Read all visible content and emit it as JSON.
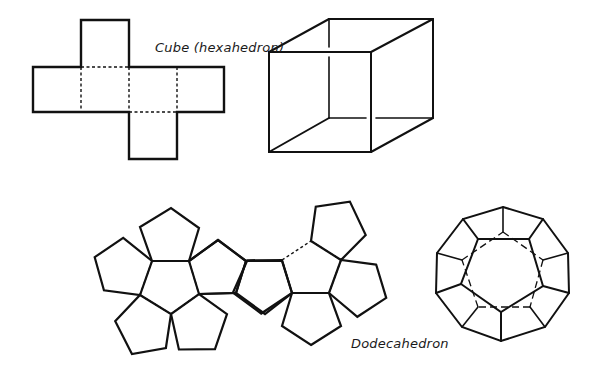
{
  "colors": {
    "stroke": "#111111",
    "background": "#ffffff"
  },
  "labels": {
    "cube": "Cube (hexahedron)",
    "dodecahedron": "Dodecahedron"
  },
  "cube_net": {
    "outline": [
      [
        81,
        20
      ],
      [
        129,
        20
      ],
      [
        129,
        67
      ],
      [
        224,
        67
      ],
      [
        224,
        112
      ],
      [
        177,
        112
      ],
      [
        177,
        159
      ],
      [
        129,
        159
      ],
      [
        129,
        112
      ],
      [
        33,
        112
      ],
      [
        33,
        67
      ],
      [
        81,
        67
      ]
    ],
    "folds": [
      [
        [
          81,
          67
        ],
        [
          129,
          67
        ]
      ],
      [
        [
          81,
          67
        ],
        [
          81,
          112
        ]
      ],
      [
        [
          129,
          67
        ],
        [
          129,
          112
        ]
      ],
      [
        [
          177,
          67
        ],
        [
          177,
          112
        ]
      ],
      [
        [
          129,
          112
        ],
        [
          177,
          112
        ]
      ]
    ]
  },
  "cube_3d": {
    "visible": [
      [
        [
          269,
          52
        ],
        [
          371,
          52
        ]
      ],
      [
        [
          371,
          52
        ],
        [
          371,
          152
        ]
      ],
      [
        [
          371,
          152
        ],
        [
          269,
          152
        ]
      ],
      [
        [
          269,
          152
        ],
        [
          269,
          52
        ]
      ],
      [
        [
          269,
          52
        ],
        [
          329,
          19
        ]
      ],
      [
        [
          329,
          19
        ],
        [
          433,
          19
        ]
      ],
      [
        [
          433,
          19
        ],
        [
          433,
          118
        ]
      ],
      [
        [
          371,
          52
        ],
        [
          433,
          19
        ]
      ],
      [
        [
          371,
          152
        ],
        [
          433,
          118
        ]
      ],
      [
        [
          269,
          152
        ],
        [
          329,
          118
        ]
      ]
    ],
    "hidden_broken": [
      [
        [
          329,
          19
        ],
        [
          329,
          47
        ]
      ],
      [
        [
          329,
          57
        ],
        [
          329,
          118
        ]
      ],
      [
        [
          329,
          118
        ],
        [
          366,
          118
        ]
      ],
      [
        [
          376,
          118
        ],
        [
          433,
          118
        ]
      ]
    ]
  },
  "dodeca_net_left": {
    "center": [
      [
        152,
        261
      ],
      [
        189,
        261
      ],
      [
        199,
        294
      ],
      [
        171,
        314
      ],
      [
        140,
        295
      ]
    ]
  },
  "dodeca_net_middle": {
    "pentagons": [
      [
        [
          189,
          261
        ],
        [
          218,
          240
        ],
        [
          246,
          261
        ],
        [
          236,
          293
        ],
        [
          199,
          294
        ]
      ],
      [
        [
          246,
          261
        ],
        [
          282,
          261
        ],
        [
          292,
          293
        ],
        [
          265,
          314
        ],
        [
          236,
          293
        ]
      ]
    ]
  },
  "dodeca_net_right": {
    "center": [
      [
        311,
        241
      ],
      [
        341,
        260
      ],
      [
        329,
        293
      ],
      [
        292,
        293
      ],
      [
        282,
        260
      ]
    ]
  },
  "dodeca_3d": {
    "outer": [
      [
        503,
        207
      ],
      [
        543,
        219
      ],
      [
        568,
        253
      ],
      [
        569,
        293
      ],
      [
        545,
        327
      ],
      [
        501,
        341
      ],
      [
        462,
        327
      ],
      [
        436,
        293
      ],
      [
        437,
        253
      ],
      [
        463,
        219
      ]
    ],
    "inner": [
      [
        478,
        239
      ],
      [
        529,
        239
      ],
      [
        543,
        286
      ],
      [
        501,
        312
      ],
      [
        461,
        284
      ]
    ],
    "back": [
      [
        503,
        232
      ],
      [
        543,
        260
      ],
      [
        530,
        307
      ],
      [
        478,
        307
      ],
      [
        462,
        260
      ]
    ]
  }
}
